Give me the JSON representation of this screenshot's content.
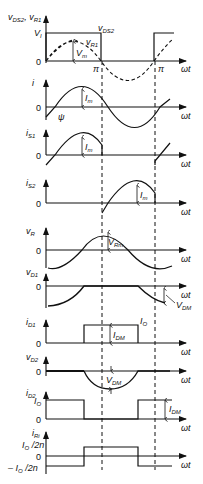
{
  "figure": {
    "type": "waveform-timing-diagram",
    "colors": {
      "line": "#111111",
      "background": "#ffffff"
    },
    "shared": {
      "x_axis_label": "ωt",
      "zero_label": "0",
      "pi_label": "π",
      "dashed_marker_label": "v_DS2"
    },
    "panels": [
      {
        "id": "vds2-vr1",
        "y_label": "v_DS2, v_R1",
        "levels": [
          "V_I",
          "0"
        ],
        "annotations": [
          "v_DS2",
          "v_R1",
          "V_m",
          "π",
          "π"
        ]
      },
      {
        "id": "i",
        "y_label": "i",
        "levels": [
          "0"
        ],
        "annotations": [
          "I_m",
          "ψ"
        ]
      },
      {
        "id": "is1",
        "y_label": "i_S1",
        "levels": [
          "0"
        ],
        "annotations": [
          "I_m"
        ]
      },
      {
        "id": "is2",
        "y_label": "i_S2",
        "levels": [
          "0"
        ],
        "annotations": [
          "I_m"
        ]
      },
      {
        "id": "vr",
        "y_label": "v_R",
        "levels": [
          "0"
        ],
        "annotations": [
          "V_Rm"
        ]
      },
      {
        "id": "vd1",
        "y_label": "v_D1",
        "levels": [
          "0"
        ],
        "annotations": [
          "V_DM"
        ]
      },
      {
        "id": "id1",
        "y_label": "i_D1",
        "levels": [
          "0"
        ],
        "annotations": [
          "I_DM",
          "I_O"
        ]
      },
      {
        "id": "vd2",
        "y_label": "v_D2",
        "levels": [
          "0"
        ],
        "annotations": [
          "V_DM"
        ]
      },
      {
        "id": "id2",
        "y_label": "i_D2",
        "levels": [
          "I_O",
          "0"
        ],
        "annotations": [
          "I_DM"
        ]
      },
      {
        "id": "iri",
        "y_label": "i_Ri",
        "levels": [
          "I_O/2n",
          "0",
          "− I_O/2n"
        ],
        "annotations": []
      }
    ]
  },
  "text": {
    "p1_ylabel_v": "v",
    "p1_ylabel_sub1": "DS2",
    "p1_ylabel_sep": ", v",
    "p1_ylabel_sub2": "R1",
    "p1_vi": "V",
    "p1_vi_sub": "I",
    "p1_vds2": "v",
    "p1_vds2_sub": "DS2",
    "p1_vr1": "v",
    "p1_vr1_sub": "R1",
    "p1_vm": "V",
    "p1_vm_sub": "m",
    "zero": "0",
    "pi": "π",
    "wt": "ωt",
    "p2_ylabel": "i",
    "p2_im": "I",
    "p2_im_sub": "m",
    "p2_psi": "ψ",
    "p3_ylabel": "i",
    "p3_ylabel_sub": "S1",
    "p3_im": "I",
    "p3_im_sub": "m",
    "p4_ylabel": "i",
    "p4_ylabel_sub": "S2",
    "p4_im": "I",
    "p4_im_sub": "m",
    "p5_ylabel": "v",
    "p5_ylabel_sub": "R",
    "p5_vrm": "V",
    "p5_vrm_sub": "Rm",
    "p6_ylabel": "v",
    "p6_ylabel_sub": "D1",
    "p6_vdm": "V",
    "p6_vdm_sub": "DM",
    "p7_ylabel": "i",
    "p7_ylabel_sub": "D1",
    "p7_idm": "I",
    "p7_idm_sub": "DM",
    "p7_io": "I",
    "p7_io_sub": "O",
    "p8_ylabel": "v",
    "p8_ylabel_sub": "D2",
    "p8_vdm": "V",
    "p8_vdm_sub": "DM",
    "p9_ylabel": "i",
    "p9_ylabel_sub": "D2",
    "p9_io": "I",
    "p9_io_sub": "O",
    "p9_idm": "I",
    "p9_idm_sub": "DM",
    "p10_ylabel": "i",
    "p10_ylabel_sub": "Ri",
    "p10_pos": "I",
    "p10_pos_sub": "O",
    "p10_pos_tail": " /2n",
    "p10_neg_pre": "– I",
    "p10_neg_sub": "O",
    "p10_neg_tail": " /2n"
  }
}
